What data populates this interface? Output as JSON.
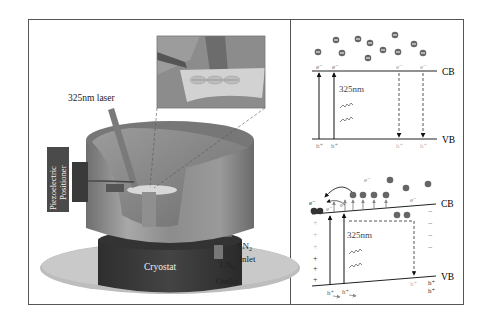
{
  "figure": {
    "left_panel": {
      "name": "Experimental setup",
      "laser_label": "325nm laser",
      "positioner_label_line1": "Piezoelectric",
      "positioner_label_line2": "Positioner",
      "cryostat_label": "Cryostat",
      "ln2_inlet_label": "LN",
      "ln2_inlet_sub": "2",
      "ln2_inlet_word": "Inlet",
      "ln2_outlet_label": "LN",
      "ln2_outlet_sub": "2",
      "ln2_outlet_word": "Outlet",
      "inset": "zoomed view of sample with three electrode contacts"
    },
    "top_right_panel": {
      "name": "Band diagram without field",
      "cb_label": "CB",
      "vb_label": "VB",
      "wavelength_label": "325nm",
      "electron_label": "e⁻",
      "hole_label": "h⁺",
      "electron_count": 12
    },
    "bottom_right_panel": {
      "name": "Band diagram with tilted bands",
      "cb_label": "CB",
      "vb_label": "VB",
      "wavelength_label": "325nm",
      "electron_label": "e⁻",
      "hole_label": "h⁺",
      "plus_sign": "+",
      "minus_sign": "−"
    },
    "colors": {
      "frame": "#555555",
      "line": "#222222",
      "electron": "#666666",
      "faded": "#aaaaaa",
      "cylinder": "#8a8a8a",
      "cryostat": "#3a3a3a",
      "platform": "#bdbdbd",
      "positioner": "#4a4a4a"
    }
  }
}
